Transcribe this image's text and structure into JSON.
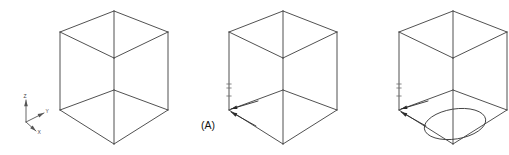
{
  "figure": {
    "background_color": "#ffffff",
    "line_color": "#3d3d3d",
    "annotation_color": "#2b2b2b",
    "width": 509,
    "height": 155
  },
  "axis_indicator": {
    "name": "coordinate-axis-triad",
    "origin": {
      "x": 26,
      "y": 122
    },
    "axes": [
      {
        "id": "z",
        "label": "Z",
        "tip": {
          "x": 26,
          "y": 100
        },
        "label_pos": {
          "x": 23.5,
          "y": 98
        }
      },
      {
        "id": "y",
        "label": "Y",
        "tip": {
          "x": 44,
          "y": 113
        },
        "label_pos": {
          "x": 45.5,
          "y": 113
        }
      },
      {
        "id": "x",
        "label": "X",
        "tip": {
          "x": 36,
          "y": 131
        },
        "label_pos": {
          "x": 37.5,
          "y": 134
        }
      }
    ]
  },
  "cubes": [
    {
      "id": "cube-1",
      "name": "isometric-cube-plain",
      "label": "",
      "has_hole": false,
      "has_callout": false,
      "has_ticks": false,
      "geometry": {
        "cx": 114,
        "top_apex": {
          "x": 114,
          "y": 11
        },
        "left_top": {
          "x": 60,
          "y": 32
        },
        "right_top": {
          "x": 168,
          "y": 32
        },
        "center_mid": {
          "x": 114,
          "y": 58
        },
        "left_bottom": {
          "x": 60,
          "y": 110
        },
        "right_bottom": {
          "x": 168,
          "y": 110
        },
        "bottom_apex": {
          "x": 114,
          "y": 144
        },
        "center_bottom": {
          "x": 114,
          "y": 90
        }
      }
    },
    {
      "id": "cube-2",
      "name": "isometric-cube-with-callout",
      "label": "(A)",
      "has_hole": false,
      "has_callout": true,
      "has_ticks": true,
      "callout": {
        "text": "(A)",
        "text_pos": {
          "x": 201,
          "y": 129
        },
        "target": {
          "x": 229,
          "y": 110
        },
        "leaders": [
          {
            "from": {
              "x": 258,
              "y": 101
            },
            "to": {
              "x": 231,
              "y": 109
            }
          },
          {
            "from": {
              "x": 256,
              "y": 126
            },
            "to": {
              "x": 231,
              "y": 112
            }
          }
        ]
      },
      "geometry": {
        "cx": 283,
        "top_apex": {
          "x": 283,
          "y": 11
        },
        "left_top": {
          "x": 229,
          "y": 32
        },
        "right_top": {
          "x": 337,
          "y": 32
        },
        "center_mid": {
          "x": 283,
          "y": 58
        },
        "left_bottom": {
          "x": 229,
          "y": 110
        },
        "right_bottom": {
          "x": 337,
          "y": 110
        },
        "bottom_apex": {
          "x": 283,
          "y": 144
        },
        "center_bottom": {
          "x": 283,
          "y": 90
        }
      }
    },
    {
      "id": "cube-3",
      "name": "isometric-cube-with-hole",
      "label": "",
      "has_hole": true,
      "has_callout": true,
      "has_ticks": true,
      "callout": {
        "text": "",
        "text_pos": {
          "x": 371,
          "y": 129
        },
        "target": {
          "x": 399,
          "y": 110
        },
        "leaders": [
          {
            "from": {
              "x": 428,
              "y": 101
            },
            "to": {
              "x": 401,
              "y": 109
            }
          },
          {
            "from": {
              "x": 426,
              "y": 126
            },
            "to": {
              "x": 401,
              "y": 112
            }
          }
        ]
      },
      "hole": {
        "name": "circular-hole-ellipse",
        "center": {
          "x": 455,
          "y": 124
        },
        "rx": 31,
        "ry": 15,
        "rotation": -9
      },
      "geometry": {
        "cx": 453,
        "top_apex": {
          "x": 453,
          "y": 11
        },
        "left_top": {
          "x": 399,
          "y": 32
        },
        "right_top": {
          "x": 507,
          "y": 32
        },
        "center_mid": {
          "x": 453,
          "y": 58
        },
        "left_bottom": {
          "x": 399,
          "y": 110
        },
        "right_bottom": {
          "x": 507,
          "y": 110
        },
        "bottom_apex": {
          "x": 453,
          "y": 144
        },
        "center_bottom": {
          "x": 453,
          "y": 90
        }
      }
    }
  ]
}
